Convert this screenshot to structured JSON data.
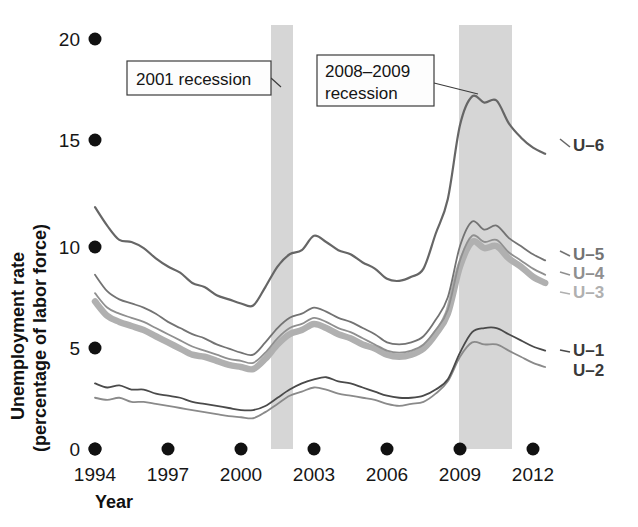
{
  "chart_data": {
    "type": "line",
    "title": "",
    "xlabel": "Year",
    "ylabel": "Unemployment rate (percentage of labor force)",
    "xlim": [
      1994,
      2012.6
    ],
    "ylim": [
      0,
      20
    ],
    "xticks": [
      "1994",
      "1997",
      "2000",
      "2003",
      "2006",
      "2009",
      "2012"
    ],
    "xtick_values": [
      1994,
      1997,
      2000,
      2003,
      2006,
      2009,
      2012
    ],
    "yticks": [
      "0",
      "5",
      "10",
      "15",
      "20"
    ],
    "ytick_values": [
      0,
      5,
      10,
      15,
      20
    ],
    "grid": false,
    "legend_position": "right-inline",
    "x": [
      1994,
      1994.5,
      1995,
      1995.5,
      1996,
      1996.5,
      1997,
      1997.5,
      1998,
      1998.5,
      1999,
      1999.5,
      2000,
      2000.5,
      2001,
      2001.5,
      2002,
      2002.5,
      2003,
      2003.5,
      2004,
      2004.5,
      2005,
      2005.5,
      2006,
      2006.5,
      2007,
      2007.5,
      2008,
      2008.5,
      2009,
      2009.5,
      2010,
      2010.5,
      2011,
      2011.5,
      2012,
      2012.5
    ],
    "series": [
      {
        "name": "U-6",
        "color": "#666666",
        "width": 2.2,
        "values": [
          11.8,
          10.9,
          10.2,
          10.1,
          9.8,
          9.3,
          8.9,
          8.6,
          8.1,
          7.9,
          7.5,
          7.3,
          7.1,
          7.0,
          7.9,
          8.9,
          9.5,
          9.7,
          10.4,
          10.1,
          9.7,
          9.5,
          9.1,
          8.8,
          8.3,
          8.2,
          8.4,
          8.8,
          10.5,
          12.2,
          15.8,
          17.2,
          16.9,
          17.0,
          15.9,
          15.2,
          14.7,
          14.4
        ]
      },
      {
        "name": "U-5",
        "color": "#737373",
        "width": 1.8,
        "values": [
          8.5,
          7.7,
          7.3,
          7.1,
          6.9,
          6.6,
          6.2,
          5.9,
          5.6,
          5.4,
          5.1,
          4.9,
          4.7,
          4.6,
          5.2,
          5.9,
          6.4,
          6.6,
          6.9,
          6.7,
          6.4,
          6.2,
          5.9,
          5.6,
          5.2,
          5.1,
          5.2,
          5.5,
          6.3,
          7.4,
          9.9,
          11.1,
          10.7,
          10.9,
          10.3,
          9.9,
          9.5,
          9.2
        ]
      },
      {
        "name": "U-4",
        "color": "#8f8f8f",
        "width": 1.8,
        "values": [
          7.6,
          6.9,
          6.6,
          6.4,
          6.2,
          5.9,
          5.6,
          5.3,
          5.0,
          4.8,
          4.6,
          4.4,
          4.3,
          4.2,
          4.7,
          5.4,
          5.9,
          6.1,
          6.4,
          6.2,
          5.9,
          5.7,
          5.4,
          5.1,
          4.8,
          4.7,
          4.8,
          5.1,
          5.8,
          6.8,
          9.2,
          10.4,
          10.1,
          10.2,
          9.6,
          9.2,
          8.8,
          8.5
        ]
      },
      {
        "name": "U-3",
        "color": "#b0b0b0",
        "width": 6.5,
        "values": [
          7.2,
          6.5,
          6.2,
          6.0,
          5.8,
          5.5,
          5.2,
          4.9,
          4.6,
          4.5,
          4.3,
          4.1,
          4.0,
          3.9,
          4.4,
          5.1,
          5.6,
          5.8,
          6.1,
          5.9,
          5.6,
          5.4,
          5.1,
          4.9,
          4.6,
          4.5,
          4.6,
          4.9,
          5.6,
          6.6,
          8.9,
          10.1,
          9.8,
          9.9,
          9.3,
          8.9,
          8.4,
          8.1
        ]
      },
      {
        "name": "U-1",
        "color": "#4a4a4a",
        "width": 1.8,
        "values": [
          3.2,
          3.0,
          3.1,
          2.9,
          2.9,
          2.7,
          2.6,
          2.5,
          2.3,
          2.2,
          2.1,
          2.0,
          1.9,
          1.9,
          2.1,
          2.5,
          2.9,
          3.2,
          3.4,
          3.5,
          3.3,
          3.2,
          3.0,
          2.8,
          2.6,
          2.5,
          2.5,
          2.6,
          2.9,
          3.4,
          4.7,
          5.7,
          5.9,
          5.9,
          5.6,
          5.3,
          5.0,
          4.8
        ]
      },
      {
        "name": "U-2",
        "color": "#8a8a8a",
        "width": 1.8,
        "values": [
          2.5,
          2.4,
          2.5,
          2.3,
          2.3,
          2.2,
          2.1,
          2.0,
          1.9,
          1.8,
          1.7,
          1.6,
          1.55,
          1.5,
          1.8,
          2.2,
          2.6,
          2.8,
          3.0,
          2.9,
          2.7,
          2.6,
          2.5,
          2.4,
          2.2,
          2.1,
          2.2,
          2.3,
          2.7,
          3.3,
          4.5,
          5.2,
          5.1,
          5.1,
          4.8,
          4.5,
          4.2,
          4.0
        ]
      }
    ],
    "recessions": [
      {
        "label": "2001 recession",
        "start": 2001.2,
        "end": 2001.9
      },
      {
        "label": "2008–2009 recession",
        "start": 2007.95,
        "end": 2009.45
      }
    ],
    "annotations": [
      {
        "id": "anno-2001",
        "lines": [
          "2001 recession"
        ]
      },
      {
        "id": "anno-2008",
        "lines": [
          "2008–2009",
          "recession"
        ]
      }
    ],
    "band_color": "#d6d6d6"
  }
}
